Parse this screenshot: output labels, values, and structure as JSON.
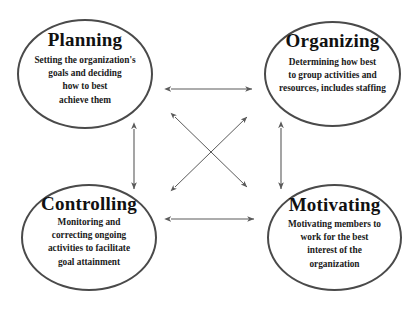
{
  "diagram": {
    "background_color": "#ffffff",
    "circle_stroke_color": "#4a4a4a",
    "arrow_color": "#5a5a5a",
    "text_color": "#111111",
    "nodes": [
      {
        "id": "planning",
        "title": "Planning",
        "description": "Setting the organization's\ngoals and deciding\nhow to best\nachieve them",
        "position": "top-left"
      },
      {
        "id": "organizing",
        "title": "Organizing",
        "description": "Determining how best\nto group activities and\nresources, includes staffing",
        "position": "top-right"
      },
      {
        "id": "controlling",
        "title": "Controlling",
        "description": "Monitoring and\ncorrecting ongoing\nactivities to facilitate\ngoal attainment",
        "position": "bottom-left"
      },
      {
        "id": "motivating",
        "title": "Motivating",
        "description": "Motivating members to\nwork for the best\ninterest of the\norganization",
        "position": "bottom-right"
      }
    ],
    "connectors": [
      {
        "id": "planning-organizing",
        "from": "planning",
        "to": "organizing",
        "style": "double-arrow",
        "orientation": "horizontal"
      },
      {
        "id": "controlling-motivating",
        "from": "controlling",
        "to": "motivating",
        "style": "double-arrow",
        "orientation": "horizontal"
      },
      {
        "id": "planning-controlling",
        "from": "planning",
        "to": "controlling",
        "style": "double-arrow",
        "orientation": "vertical"
      },
      {
        "id": "organizing-motivating",
        "from": "organizing",
        "to": "motivating",
        "style": "double-arrow",
        "orientation": "vertical"
      },
      {
        "id": "planning-motivating",
        "from": "planning",
        "to": "motivating",
        "style": "double-arrow",
        "orientation": "diagonal"
      },
      {
        "id": "controlling-organizing",
        "from": "controlling",
        "to": "organizing",
        "style": "double-arrow",
        "orientation": "diagonal"
      }
    ]
  }
}
